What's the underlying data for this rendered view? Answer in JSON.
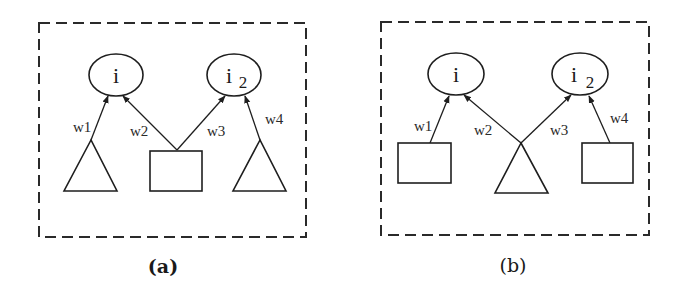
{
  "panels": [
    {
      "id": "a",
      "caption": "(a)",
      "caption_bold": true,
      "nodes": {
        "top_left": {
          "label": "i",
          "sub": ""
        },
        "top_right": {
          "label": "i",
          "sub": "2"
        }
      },
      "bottom_shapes": [
        "triangle",
        "rectangle",
        "triangle"
      ],
      "edges": [
        {
          "label": "w1",
          "from": "bottom_left",
          "to": "top_left"
        },
        {
          "label": "w2",
          "from": "bottom_middle",
          "to": "top_left"
        },
        {
          "label": "w3",
          "from": "bottom_middle",
          "to": "top_right"
        },
        {
          "label": "w4",
          "from": "bottom_right",
          "to": "top_right"
        }
      ]
    },
    {
      "id": "b",
      "caption": "(b)",
      "caption_bold": false,
      "nodes": {
        "top_left": {
          "label": "i",
          "sub": ""
        },
        "top_right": {
          "label": "i",
          "sub": "2"
        }
      },
      "bottom_shapes": [
        "rectangle",
        "triangle",
        "rectangle"
      ],
      "edges": [
        {
          "label": "w1",
          "from": "bottom_left",
          "to": "top_left"
        },
        {
          "label": "w2",
          "from": "bottom_middle",
          "to": "top_left"
        },
        {
          "label": "w3",
          "from": "bottom_middle",
          "to": "top_right"
        },
        {
          "label": "w4",
          "from": "bottom_right",
          "to": "top_right"
        }
      ]
    }
  ],
  "colors": {
    "stroke": "#1e1e1e",
    "background": "#ffffff"
  }
}
